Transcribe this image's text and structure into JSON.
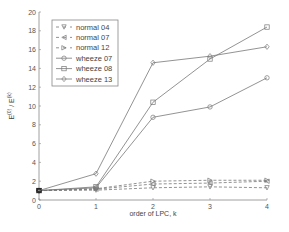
{
  "chart_data": {
    "type": "line",
    "title": "",
    "xlabel": "order of LPC, k",
    "ylabel": "E(0) / E(k)",
    "ylabel_main": "E",
    "ylabel_sup0": "(0)",
    "ylabel_mid": " / E",
    "ylabel_supk": "(k)",
    "x": [
      0,
      1,
      2,
      3,
      4
    ],
    "xlim": [
      0,
      4
    ],
    "ylim": [
      0,
      20
    ],
    "xticks": [
      0,
      1,
      2,
      3,
      4
    ],
    "yticks": [
      0,
      2,
      4,
      6,
      8,
      10,
      12,
      14,
      16,
      18,
      20
    ],
    "grid": false,
    "legend_position": "upper left",
    "series": [
      {
        "name": "normal 04",
        "style": "dashed",
        "marker": "triangle-down",
        "values": [
          1.0,
          1.05,
          1.3,
          1.4,
          1.3
        ]
      },
      {
        "name": "normal 07",
        "style": "dashed",
        "marker": "triangle-left",
        "values": [
          1.0,
          1.15,
          1.7,
          1.8,
          2.0
        ]
      },
      {
        "name": "normal 12",
        "style": "dashed",
        "marker": "triangle-right",
        "values": [
          1.0,
          1.2,
          2.0,
          2.1,
          2.1
        ]
      },
      {
        "name": "wheeze 07",
        "style": "solid",
        "marker": "circle",
        "values": [
          1.0,
          1.3,
          8.8,
          9.9,
          13.0
        ]
      },
      {
        "name": "wheeze 08",
        "style": "solid",
        "marker": "square",
        "values": [
          1.0,
          1.4,
          10.4,
          15.0,
          18.4
        ]
      },
      {
        "name": "wheeze 13",
        "style": "solid",
        "marker": "diamond",
        "values": [
          1.0,
          2.8,
          14.6,
          15.3,
          16.3
        ]
      }
    ]
  },
  "colors": {
    "line": "#777777",
    "axis": "#888888",
    "marker_first": "#222222"
  }
}
